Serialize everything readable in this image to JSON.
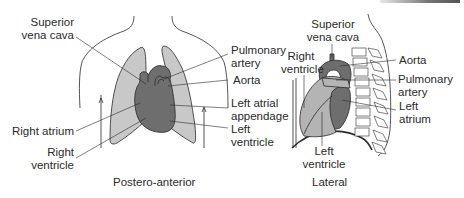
{
  "diagram": {
    "type": "anatomical-illustration",
    "colors": {
      "lung": "#c8c8c8",
      "heart": "#6e6e6e",
      "heart_light": "#b4b4b4",
      "outline": "#2a2a2a",
      "text": "#2a2a2a"
    },
    "views": [
      {
        "caption": "Postero-anterior",
        "labels": {
          "svc_1": "Superior",
          "svc_2": "vena cava",
          "right_atrium": "Right atrium",
          "rv_1": "Right",
          "rv_2": "ventricle",
          "pa_1": "Pulmonary",
          "pa_2": "artery",
          "aorta": "Aorta",
          "laa_1": "Left atrial",
          "laa_2": "appendage",
          "lv_1": "Left",
          "lv_2": "ventricle"
        }
      },
      {
        "caption": "Lateral",
        "labels": {
          "svc_1": "Superior",
          "svc_2": "vena cava",
          "rv_1": "Right",
          "rv_2": "ventricle",
          "aorta": "Aorta",
          "pa_1": "Pulmonary",
          "pa_2": "artery",
          "la_1": "Left",
          "la_2": "atrium",
          "lv_1": "Left",
          "lv_2": "ventricle"
        }
      }
    ]
  }
}
